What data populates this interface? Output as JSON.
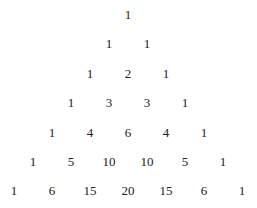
{
  "rows": [
    [
      1
    ],
    [
      1,
      1
    ],
    [
      1,
      2,
      1
    ],
    [
      1,
      3,
      3,
      1
    ],
    [
      1,
      4,
      6,
      4,
      1
    ],
    [
      1,
      5,
      10,
      10,
      5,
      1
    ],
    [
      1,
      6,
      15,
      20,
      15,
      6,
      1
    ]
  ],
  "text_color": "#222222",
  "background": "#ffffff"
}
